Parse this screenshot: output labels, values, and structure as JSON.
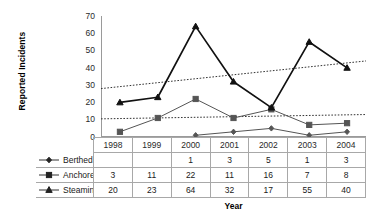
{
  "chart_data": {
    "type": "line",
    "title": "",
    "xlabel": "Year",
    "ylabel": "Reported Incidents",
    "categories": [
      "1998",
      "1999",
      "2000",
      "2001",
      "2002",
      "2003",
      "2004"
    ],
    "ylim": [
      0,
      70
    ],
    "yticks": [
      0,
      10,
      20,
      30,
      40,
      50,
      60,
      70
    ],
    "grid": false,
    "legend_position": "table-row-labels",
    "series": [
      {
        "name": "Berthed",
        "marker": "diamond",
        "color": "#555555",
        "values": [
          null,
          null,
          1,
          3,
          5,
          1,
          3
        ],
        "display_values": [
          "",
          "",
          "1",
          "3",
          "5",
          "1",
          "3"
        ]
      },
      {
        "name": "Anchored",
        "marker": "square",
        "color": "#555555",
        "values": [
          3,
          11,
          22,
          11,
          16,
          7,
          8
        ],
        "display_values": [
          "3",
          "11",
          "22",
          "11",
          "16",
          "7",
          "8"
        ]
      },
      {
        "name": "Steaming",
        "marker": "triangle",
        "color": "#111111",
        "values": [
          20,
          23,
          64,
          32,
          17,
          55,
          40
        ],
        "display_values": [
          "20",
          "23",
          "64",
          "32",
          "17",
          "55",
          "40"
        ]
      }
    ],
    "trendlines": [
      {
        "name": "Steaming trendline",
        "style": "dotted",
        "color": "#333333",
        "start": 28,
        "end": 44
      },
      {
        "name": "Anchored trendline",
        "style": "dotted",
        "color": "#333333",
        "start": 10.5,
        "end": 13
      }
    ]
  },
  "table": {
    "year_header": [
      "1998",
      "1999",
      "2000",
      "2001",
      "2002",
      "2003",
      "2004"
    ],
    "rows": [
      {
        "label": "Berthed",
        "marker": "diamond",
        "cells": [
          "",
          "",
          "1",
          "3",
          "5",
          "1",
          "3"
        ]
      },
      {
        "label": "Anchored",
        "marker": "square",
        "cells": [
          "3",
          "11",
          "22",
          "11",
          "16",
          "7",
          "8"
        ]
      },
      {
        "label": "Steaming",
        "marker": "triangle",
        "cells": [
          "20",
          "23",
          "64",
          "32",
          "17",
          "55",
          "40"
        ]
      }
    ]
  },
  "axes": {
    "y_title": "Reported Incidents",
    "x_title": "Year",
    "y_tick_labels": [
      "70",
      "60",
      "50",
      "40",
      "30",
      "20",
      "10",
      "0"
    ]
  },
  "colors": {
    "axis": "#9a9a9a",
    "grid_border": "#a8a8a8",
    "series_dark": "#111111",
    "series_mid": "#555555",
    "text": "#202020",
    "background": "#ffffff"
  }
}
